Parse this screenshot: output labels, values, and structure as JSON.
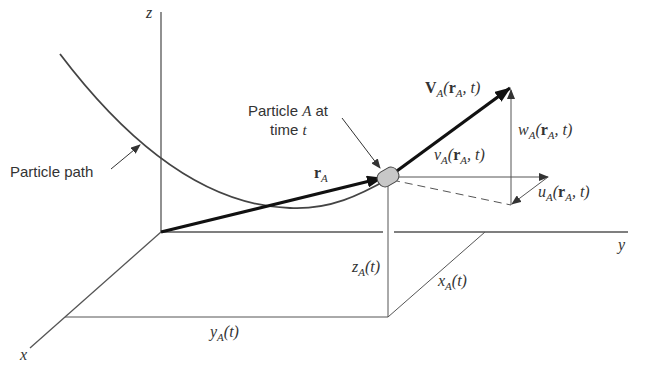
{
  "diagram": {
    "axes": {
      "x": "x",
      "y": "y",
      "z": "z"
    },
    "labels": {
      "particle_path": "Particle path",
      "particle_a_line1": "Particle A at",
      "particle_a_line2": "time t",
      "position_vector": "rA",
      "velocity": "VA(rA, t)",
      "u_component": "uA(rA, t)",
      "v_component": "vA(rA, t)",
      "w_component": "wA(rA, t)",
      "x_coord": "xA(t)",
      "y_coord": "yA(t)",
      "z_coord": "zA(t)"
    },
    "colors": {
      "line": "#444444",
      "particle_fill": "#c8c8c8"
    }
  }
}
